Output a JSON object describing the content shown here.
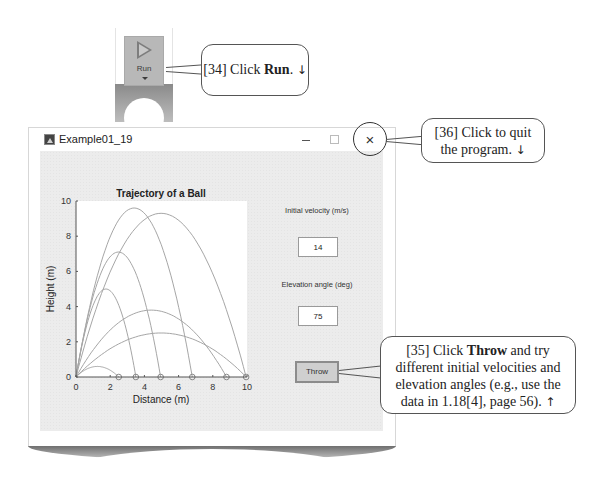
{
  "toolstrip": {
    "run_button": {
      "label": "Run",
      "icon": "play-icon"
    }
  },
  "callouts": {
    "step34": {
      "prefix": "[34] Click ",
      "bold": "Run",
      "suffix": ".",
      "arrow": "↓"
    },
    "step36": {
      "line1": "[36] Click to quit",
      "line2": "the program.",
      "arrow": "↓"
    },
    "step35": {
      "prefix": "[35] Click ",
      "bold": "Throw",
      "line1_suffix": " and try",
      "line2": "different initial velocities and",
      "line3": "elevation angles (e.g., use the",
      "line4": "data in 1.18[4], page 56).",
      "arrow": "↑"
    }
  },
  "window": {
    "title": "Example01_19",
    "icon": "matlab-figure-icon",
    "minimize": "–",
    "maximize": "□",
    "close": "×"
  },
  "controls": {
    "velocity_label": "Initial velocity (m/s)",
    "velocity_value": "14",
    "angle_label": "Elevation angle (deg)",
    "angle_value": "75",
    "throw_label": "Throw"
  },
  "chart_data": {
    "type": "line",
    "title": "Trajectory of a Ball",
    "xlabel": "Distance (m)",
    "ylabel": "Height (m)",
    "xlim": [
      0,
      10
    ],
    "ylim": [
      0,
      10
    ],
    "xticks": [
      0,
      2,
      4,
      6,
      8,
      10
    ],
    "yticks": [
      0,
      2,
      4,
      6,
      8,
      10
    ],
    "grid": false,
    "line_color": "#a0a0a0",
    "series": [
      {
        "name": "trajectory 1",
        "range": 2.5,
        "peak_height": 0.6
      },
      {
        "name": "trajectory 2",
        "range": 3.5,
        "peak_height": 5.0
      },
      {
        "name": "trajectory 3",
        "range": 4.95,
        "peak_height": 7.1
      },
      {
        "name": "trajectory 4",
        "range": 6.8,
        "peak_height": 9.6
      },
      {
        "name": "trajectory 5",
        "range": 9.95,
        "peak_height": 9.3
      },
      {
        "name": "trajectory 6",
        "range": 8.8,
        "peak_height": 3.8
      },
      {
        "name": "trajectory 7",
        "range": 9.95,
        "peak_height": 2.5
      }
    ],
    "landing_markers": [
      2.5,
      3.5,
      4.95,
      6.8,
      8.8,
      9.95
    ]
  }
}
